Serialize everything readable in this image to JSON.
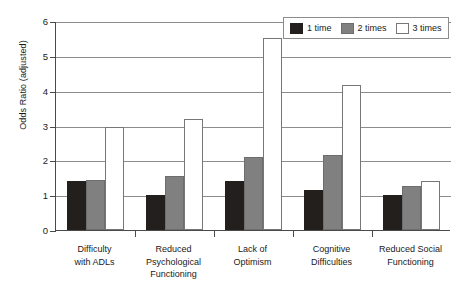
{
  "chart_data": {
    "type": "bar",
    "title": "",
    "xlabel": "",
    "ylabel": "Odds Ratio (adjusted)",
    "ylim": [
      0,
      6
    ],
    "yticks": [
      0,
      1,
      2,
      3,
      4,
      5,
      6
    ],
    "grid": true,
    "legend_position": "top-right",
    "categories": [
      "Difficulty\nwith ADLs",
      "Reduced\nPsychological\nFunctioning",
      "Lack of\nOptimism",
      "Cognitive\nDifficulties",
      "Reduced Social\nFunctioning"
    ],
    "series": [
      {
        "name": "1 time",
        "color": "#231f1c",
        "values": [
          1.4,
          1.0,
          1.4,
          1.15,
          1.0
        ]
      },
      {
        "name": "2 times",
        "color": "#808080",
        "values": [
          1.45,
          1.55,
          2.1,
          2.15,
          1.25
        ]
      },
      {
        "name": "3 times",
        "color": "#ffffff",
        "values": [
          2.95,
          3.2,
          5.5,
          4.15,
          1.4
        ]
      }
    ]
  },
  "axis": {
    "y_title": "Odds Ratio (adjusted)"
  },
  "legend": {
    "items": [
      {
        "label": "1 time"
      },
      {
        "label": "2 times"
      },
      {
        "label": "3 times"
      }
    ]
  }
}
